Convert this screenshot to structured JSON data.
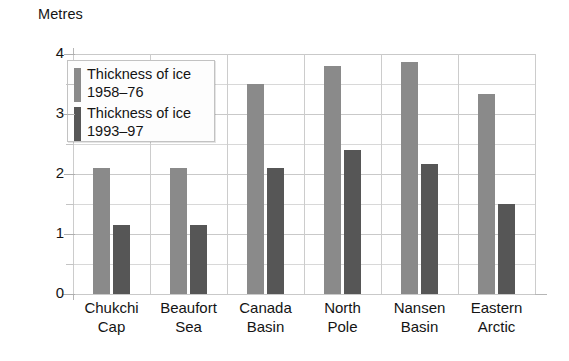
{
  "chart_data": {
    "type": "bar",
    "title": "",
    "ylabel": "Metres",
    "xlabel": "",
    "ylim": [
      0,
      4
    ],
    "yticks": [
      "0",
      "1",
      "2",
      "3",
      "4"
    ],
    "ytick_values": [
      0,
      1,
      2,
      3,
      4
    ],
    "minor_tick_step": 0.5,
    "grid": true,
    "legend_position": "upper-left-inside",
    "categories": [
      "Chukchi Cap",
      "Beaufort Sea",
      "Canada Basin",
      "North Pole",
      "Nansen Basin",
      "Eastern Arctic"
    ],
    "category_lines": [
      [
        "Chukchi",
        "Cap"
      ],
      [
        "Beaufort",
        "Sea"
      ],
      [
        "Canada",
        "Basin"
      ],
      [
        "North",
        "Pole"
      ],
      [
        "Nansen",
        "Basin"
      ],
      [
        "Eastern",
        "Arctic"
      ]
    ],
    "series": [
      {
        "name": "Thickness of ice 1958–76",
        "name_lines": [
          "Thickness of ice",
          "1958–76"
        ],
        "color": "#8a8a8a",
        "values": [
          2.1,
          2.1,
          3.5,
          3.8,
          3.87,
          3.33
        ]
      },
      {
        "name": "Thickness of ice 1993–97",
        "name_lines": [
          "Thickness of ice",
          "1993–97"
        ],
        "color": "#565656",
        "values": [
          1.15,
          1.15,
          2.1,
          2.4,
          2.17,
          1.5
        ]
      }
    ]
  }
}
